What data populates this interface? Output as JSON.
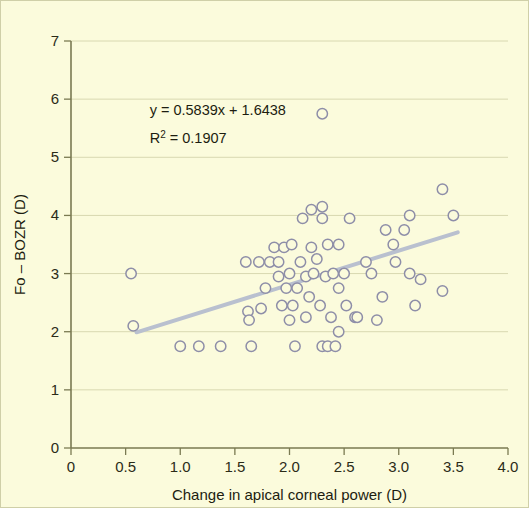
{
  "chart_data": {
    "type": "scatter",
    "title": "",
    "xlabel": "Change in apical corneal power (D)",
    "ylabel": "Fo – BOZR (D)",
    "xlim": [
      0,
      4.0
    ],
    "ylim": [
      0,
      7
    ],
    "xticks": [
      "0",
      "0.5",
      "1.0",
      "1.5",
      "2.0",
      "2.5",
      "3.0",
      "3.5",
      "4.0"
    ],
    "xtick_values": [
      0,
      0.5,
      1.0,
      1.5,
      2.0,
      2.5,
      3.0,
      3.5,
      4.0
    ],
    "yticks": [
      "0",
      "1",
      "2",
      "3",
      "4",
      "5",
      "6",
      "7"
    ],
    "ytick_values": [
      0,
      1,
      2,
      3,
      4,
      5,
      6,
      7
    ],
    "grid": "horizontal",
    "legend": "none",
    "marker": "open-circle",
    "marker_color": "#8e8ea8",
    "trendline_color": "#b9c0cf",
    "background_color": "#fbfbdc",
    "annotations": [
      {
        "text": "y = 0.5839x + 1.6438",
        "x": 0.72,
        "y": 5.72
      },
      {
        "text": "R2 = 0.1907",
        "display": "R² = 0.1907",
        "x": 0.72,
        "y": 5.25
      }
    ],
    "equation": "y = 0.5839x + 1.6438",
    "r_squared_label": "R² = 0.1907",
    "r_squared": 0.1907,
    "slope": 0.5839,
    "intercept": 1.6438,
    "trendline": {
      "x0": 0.6,
      "y0": 1.99,
      "x1": 3.54,
      "y1": 3.71
    },
    "points": [
      [
        0.55,
        3.0
      ],
      [
        0.57,
        2.1
      ],
      [
        1.0,
        1.75
      ],
      [
        1.17,
        1.75
      ],
      [
        1.37,
        1.75
      ],
      [
        1.6,
        3.2
      ],
      [
        1.62,
        2.35
      ],
      [
        1.63,
        2.2
      ],
      [
        1.65,
        1.75
      ],
      [
        1.72,
        3.2
      ],
      [
        1.74,
        2.4
      ],
      [
        1.78,
        2.75
      ],
      [
        1.82,
        3.2
      ],
      [
        1.86,
        3.45
      ],
      [
        1.9,
        3.2
      ],
      [
        1.9,
        2.95
      ],
      [
        1.93,
        2.45
      ],
      [
        1.95,
        3.45
      ],
      [
        1.97,
        2.75
      ],
      [
        2.0,
        3.0
      ],
      [
        2.0,
        2.2
      ],
      [
        2.02,
        3.5
      ],
      [
        2.03,
        2.45
      ],
      [
        2.05,
        1.75
      ],
      [
        2.07,
        2.75
      ],
      [
        2.1,
        3.2
      ],
      [
        2.12,
        3.95
      ],
      [
        2.15,
        2.95
      ],
      [
        2.15,
        2.25
      ],
      [
        2.18,
        2.6
      ],
      [
        2.2,
        3.45
      ],
      [
        2.2,
        4.1
      ],
      [
        2.22,
        3.0
      ],
      [
        2.25,
        3.25
      ],
      [
        2.28,
        2.45
      ],
      [
        2.3,
        5.75
      ],
      [
        2.3,
        4.15
      ],
      [
        2.3,
        3.95
      ],
      [
        2.3,
        1.75
      ],
      [
        2.33,
        2.95
      ],
      [
        2.35,
        3.5
      ],
      [
        2.35,
        1.75
      ],
      [
        2.38,
        2.25
      ],
      [
        2.4,
        3.0
      ],
      [
        2.42,
        1.75
      ],
      [
        2.45,
        3.5
      ],
      [
        2.45,
        2.75
      ],
      [
        2.45,
        2.0
      ],
      [
        2.5,
        3.0
      ],
      [
        2.52,
        2.45
      ],
      [
        2.55,
        3.95
      ],
      [
        2.6,
        2.25
      ],
      [
        2.62,
        2.25
      ],
      [
        2.7,
        3.2
      ],
      [
        2.75,
        3.0
      ],
      [
        2.8,
        2.2
      ],
      [
        2.85,
        2.6
      ],
      [
        2.88,
        3.75
      ],
      [
        2.95,
        3.5
      ],
      [
        2.97,
        3.2
      ],
      [
        3.05,
        3.75
      ],
      [
        3.1,
        4.0
      ],
      [
        3.1,
        3.0
      ],
      [
        3.15,
        2.45
      ],
      [
        3.2,
        2.9
      ],
      [
        3.4,
        4.45
      ],
      [
        3.4,
        2.7
      ],
      [
        3.5,
        4.0
      ]
    ]
  }
}
